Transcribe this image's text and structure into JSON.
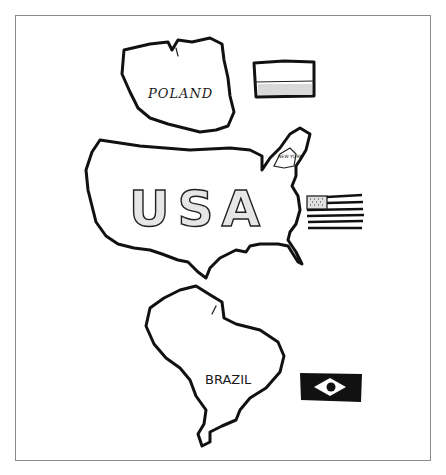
{
  "drawing": {
    "countries": [
      {
        "name": "POLAND",
        "flag": {
          "colors": [
            "#ffffff",
            "#d9d9d9"
          ],
          "description": "two horizontal bands, white over shaded"
        }
      },
      {
        "name": "USA",
        "sublabel": "NEW YORK",
        "flag": {
          "description": "stars canton with horizontal stripes"
        }
      },
      {
        "name": "BRAZIL",
        "flag": {
          "description": "dark field with white diamond and dark circle",
          "field_color": "#111111"
        }
      }
    ]
  }
}
